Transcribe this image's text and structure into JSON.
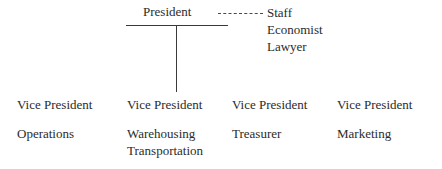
{
  "chart": {
    "type": "org-chart",
    "background_color": "#ffffff",
    "text_color": "#2b2b2b",
    "line_color": "#3a3a3a"
  },
  "top": {
    "title": "President",
    "connector_style": "dashed"
  },
  "staff": {
    "lines": [
      "Staff",
      "Economist",
      "Lawyer"
    ]
  },
  "columns": [
    {
      "title": "Vice President",
      "functions": [
        "Operations"
      ]
    },
    {
      "title": "Vice President",
      "functions": [
        "Warehousing",
        "Transportation"
      ]
    },
    {
      "title": "Vice President",
      "functions": [
        "Treasurer"
      ]
    },
    {
      "title": "Vice President",
      "functions": [
        "Marketing"
      ]
    }
  ]
}
